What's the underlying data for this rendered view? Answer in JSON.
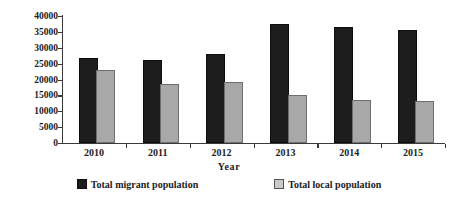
{
  "chart_data": {
    "type": "bar",
    "title": "",
    "xlabel": "Year",
    "ylabel": "Population  (person)",
    "categories": [
      "2010",
      "2011",
      "2012",
      "2013",
      "2014",
      "2015"
    ],
    "series": [
      {
        "name": "Total migrant population",
        "color": "#1d1d1d",
        "values": [
          26000,
          25500,
          27500,
          37000,
          36000,
          35000
        ]
      },
      {
        "name": "Total local population",
        "color": "#a8a8a8",
        "values": [
          22500,
          18000,
          18500,
          14500,
          13000,
          12500
        ]
      }
    ],
    "ylim": [
      0,
      40000
    ],
    "ytick_labels": [
      "0",
      "5000",
      "10000",
      "15000",
      "20000",
      "25000",
      "30000",
      "35000",
      "40000"
    ],
    "ytick_values": [
      0,
      5000,
      10000,
      15000,
      20000,
      25000,
      30000,
      35000,
      40000
    ],
    "grid": false,
    "legend_position": "bottom"
  },
  "legend": {
    "items": [
      {
        "label": "Total migrant population",
        "swatch": "migrant-swatch-icon"
      },
      {
        "label": "Total local population",
        "swatch": "local-swatch-icon"
      }
    ]
  }
}
